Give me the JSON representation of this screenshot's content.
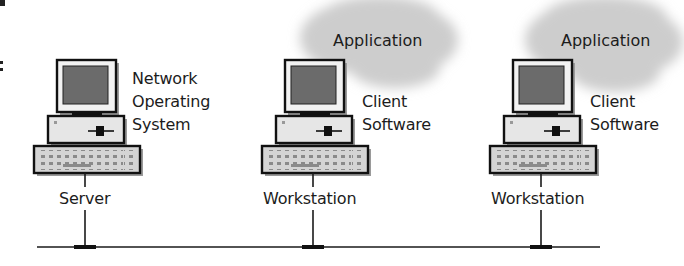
{
  "diagram": {
    "title": "",
    "colors": {
      "line": "#1a1a1a",
      "cloud": "#cfcfcf",
      "screen": "#6b6b6b",
      "case": "#e6e6e6",
      "keyboard": "#d4d4d4"
    },
    "nodes": [
      {
        "id": "server",
        "name": "Server",
        "software": [
          "Network",
          "Operating",
          "System"
        ],
        "cloud": null
      },
      {
        "id": "workstation-1",
        "name": "Workstation",
        "software": [
          "Client",
          "Software"
        ],
        "cloud": "Application"
      },
      {
        "id": "workstation-2",
        "name": "Workstation",
        "software": [
          "Client",
          "Software"
        ],
        "cloud": "Application"
      }
    ],
    "network_bus": "network-cable"
  }
}
